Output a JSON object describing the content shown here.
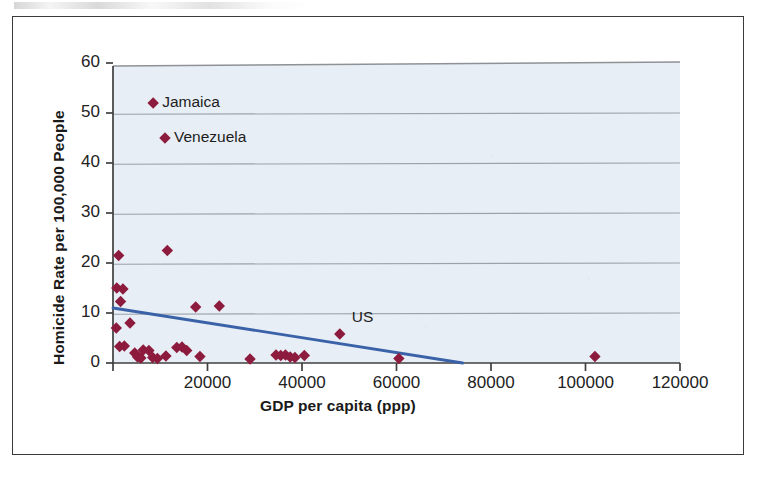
{
  "figure": {
    "background_color": "#ffffff",
    "border_color": "#3a3a3a",
    "plot_background_color": "#e8eef5"
  },
  "chart_data": {
    "type": "scatter",
    "title": "",
    "xlabel": "GDP per capita (ppp)",
    "ylabel": "Homicide Rate per 100,000 People",
    "xlim": [
      0,
      120000
    ],
    "ylim": [
      0,
      60
    ],
    "xticks": [
      0,
      20000,
      40000,
      60000,
      80000,
      100000,
      120000
    ],
    "xtick_labels": [
      "",
      "20000",
      "40000",
      "60000",
      "80000",
      "100000",
      "120000"
    ],
    "yticks": [
      0,
      10,
      20,
      30,
      40,
      50,
      60
    ],
    "ytick_labels": [
      "0",
      "10",
      "20",
      "30",
      "40",
      "50",
      "60"
    ],
    "grid": "horizontal",
    "legend": "none",
    "marker": {
      "shape": "diamond",
      "color": "#8d1b3d",
      "size": 9
    },
    "series": [
      {
        "name": "Countries",
        "points": [
          {
            "x": 1200,
            "y": 21.5
          },
          {
            "x": 800,
            "y": 15.0
          },
          {
            "x": 2100,
            "y": 14.8
          },
          {
            "x": 1600,
            "y": 12.3
          },
          {
            "x": 700,
            "y": 7.0
          },
          {
            "x": 3600,
            "y": 8.0
          },
          {
            "x": 8500,
            "y": 52.0,
            "label": "Jamaica"
          },
          {
            "x": 11000,
            "y": 45.0,
            "label": "Venezuela"
          },
          {
            "x": 11500,
            "y": 22.5
          },
          {
            "x": 17500,
            "y": 11.2
          },
          {
            "x": 22500,
            "y": 11.4
          },
          {
            "x": 1400,
            "y": 3.3
          },
          {
            "x": 2400,
            "y": 3.4
          },
          {
            "x": 4600,
            "y": 2.0
          },
          {
            "x": 5200,
            "y": 1.2
          },
          {
            "x": 5900,
            "y": 1.0
          },
          {
            "x": 6400,
            "y": 2.6
          },
          {
            "x": 7600,
            "y": 2.5
          },
          {
            "x": 8400,
            "y": 1.1
          },
          {
            "x": 9400,
            "y": 0.9
          },
          {
            "x": 11200,
            "y": 1.4
          },
          {
            "x": 13500,
            "y": 3.1
          },
          {
            "x": 14600,
            "y": 3.2
          },
          {
            "x": 15600,
            "y": 2.5
          },
          {
            "x": 18400,
            "y": 1.3
          },
          {
            "x": 29000,
            "y": 0.8
          },
          {
            "x": 34500,
            "y": 1.6
          },
          {
            "x": 35500,
            "y": 1.5
          },
          {
            "x": 36500,
            "y": 1.6
          },
          {
            "x": 37500,
            "y": 1.2
          },
          {
            "x": 38500,
            "y": 1.1
          },
          {
            "x": 40500,
            "y": 1.5
          },
          {
            "x": 48000,
            "y": 5.8,
            "label": "US"
          },
          {
            "x": 60500,
            "y": 0.9
          },
          {
            "x": 102000,
            "y": 1.3
          }
        ]
      }
    ],
    "trendline": {
      "type": "linear",
      "color": "#3a62a8",
      "x_start": 0,
      "y_start": 11.0,
      "x_end": 74000,
      "y_end": 0.0
    },
    "annotations": [
      {
        "text": "Jamaica",
        "x": 8500,
        "y": 52.0,
        "position": "right"
      },
      {
        "text": "Venezuela",
        "x": 11000,
        "y": 45.0,
        "position": "right"
      },
      {
        "text": "US",
        "x": 48000,
        "y": 5.8,
        "position": "upper-right"
      }
    ]
  }
}
